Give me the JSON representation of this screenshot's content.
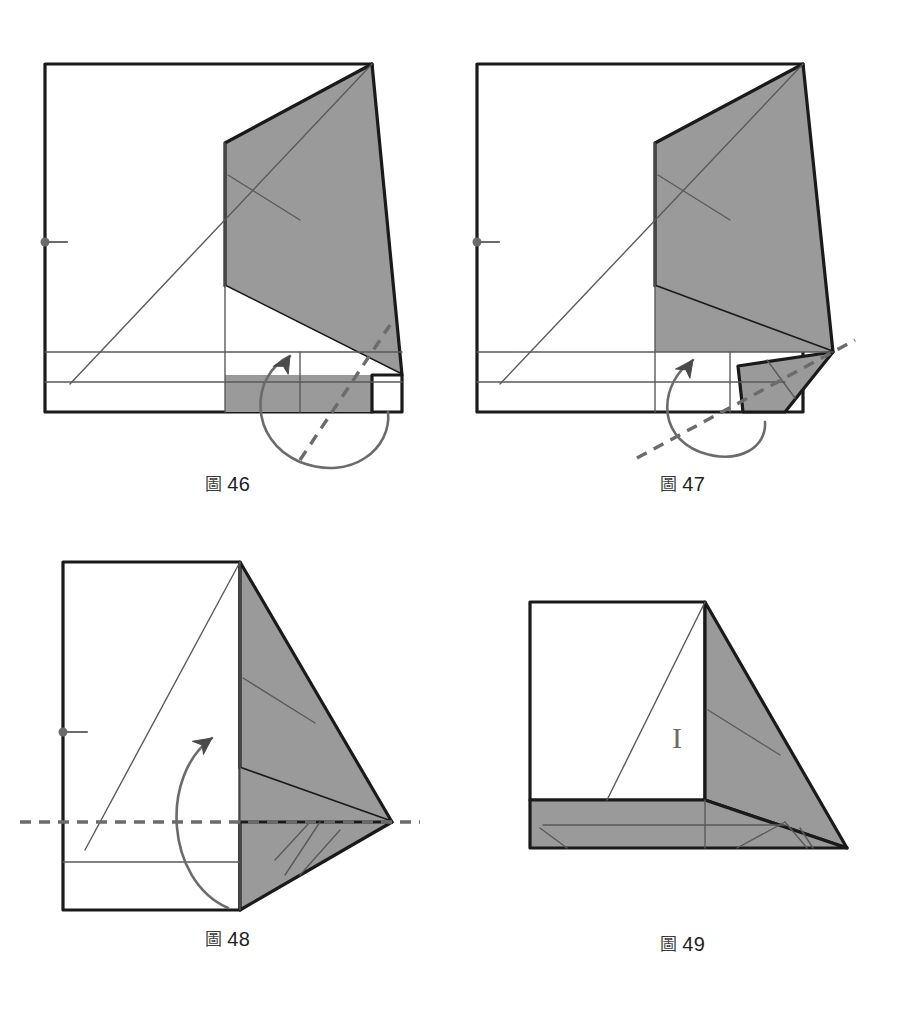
{
  "page": {
    "width": 909,
    "height": 1016,
    "background": "#ffffff",
    "document_type": "origami-folding-instruction-diagram",
    "language": "zh"
  },
  "style": {
    "paper_fill": "#ffffff",
    "shaded_fill": "#9a9a9a",
    "outline_color": "#1a1a1a",
    "crease_color": "#5a5a5a",
    "fold_line_color": "#6b6b6b",
    "arrow_color": "#6b6b6b",
    "marker_color": "#6b6b6b",
    "outline_width": 3.2,
    "crease_width": 1.4,
    "fold_dash": "11 8"
  },
  "figures": [
    {
      "id": "fig-46",
      "caption_mark": "圖",
      "caption_number": "46",
      "caption_text": "圖 46",
      "cell": {
        "left": 0,
        "top": 30,
        "width": 455,
        "height": 470
      },
      "viewbox": "0 0 455 470",
      "caption_top": 440,
      "shapes": {
        "main_sheet": "45,34 372,34 372,345 372,382 400,382 400,382 45,382",
        "white_body": "45,34 372,34 372,382 45,382",
        "shaded_upper": "372,34 400,345 225,256 225,114",
        "shaded_lower": "225,256 400,345 372,382 225,300",
        "shaded_blade": "372,34 400,345 225,256 225,114",
        "right_flap": "372,345 400,345 400,382 372,382",
        "bottom_band": "45,345 400,345 400,382 45,382"
      },
      "polygons": [
        {
          "name": "paper-body",
          "points": "45,34 372,34 372,382 45,382",
          "fill": "#ffffff",
          "stroke": "#1a1a1a",
          "stroke_width": 3.2
        },
        {
          "name": "shaded-flap",
          "points": "372,34 402,345 225,256 225,113",
          "fill": "#9a9a9a",
          "stroke": "#1a1a1a",
          "stroke_width": 3.2
        },
        {
          "name": "shaded-lower-wedge",
          "points": "225,256 402,345 372,382 225,382",
          "fill": "#9a9a9a",
          "stroke": "none",
          "stroke_width": 0
        },
        {
          "name": "white-under-wedge",
          "points": "225,256 402,345 225,345",
          "fill": "#ffffff",
          "stroke": "none",
          "stroke_width": 0
        },
        {
          "name": "right-tab",
          "points": "372,345 402,345 402,382 372,382",
          "fill": "#ffffff",
          "stroke": "#1a1a1a",
          "stroke_width": 3.2
        }
      ],
      "creases": [
        {
          "name": "diagonal-crease",
          "x1": 70,
          "y1": 354,
          "x2": 372,
          "y2": 34
        },
        {
          "name": "vertical-crease",
          "x1": 225,
          "y1": 113,
          "x2": 225,
          "y2": 382
        },
        {
          "name": "horizontal-crease-upper",
          "x1": 45,
          "y1": 322,
          "x2": 402,
          "y2": 322
        },
        {
          "name": "horizontal-crease-lower",
          "x1": 45,
          "y1": 352,
          "x2": 402,
          "y2": 352
        },
        {
          "name": "vertical-crease-right",
          "x1": 300,
          "y1": 322,
          "x2": 300,
          "y2": 382
        },
        {
          "name": "flap-inner-crease",
          "x1": 228,
          "y1": 145,
          "x2": 300,
          "y2": 190
        }
      ],
      "fold_lines": [
        {
          "name": "valley-fold-line",
          "x1": 300,
          "y1": 430,
          "x2": 390,
          "y2": 295,
          "dashed": true
        }
      ],
      "arrows": [
        {
          "name": "fold-rotate-arrow",
          "type": "loop",
          "path": "M 290,326 C 250,345 248,410 300,432 C 352,452 392,418 388,382",
          "head_at": "start",
          "head_angle": -62
        }
      ],
      "markers": [
        {
          "name": "reference-point",
          "type": "dot-tick",
          "x": 45,
          "y": 212,
          "tick_length": 22,
          "radius": 4.5
        }
      ]
    },
    {
      "id": "fig-47",
      "caption_mark": "圖",
      "caption_number": "47",
      "caption_text": "圖 47",
      "cell": {
        "left": 455,
        "top": 30,
        "width": 455,
        "height": 470
      },
      "viewbox": "0 0 455 470",
      "caption_top": 440,
      "polygons": [
        {
          "name": "paper-body",
          "points": "22,34 348,34 348,382 22,382",
          "fill": "#ffffff",
          "stroke": "#1a1a1a",
          "stroke_width": 3.2
        },
        {
          "name": "shaded-flap",
          "points": "348,34 378,322 200,256 200,113",
          "fill": "#9a9a9a",
          "stroke": "#1a1a1a",
          "stroke_width": 3.2
        },
        {
          "name": "shaded-lower-wedge",
          "points": "200,256 378,322 330,322 200,322",
          "fill": "#9a9a9a",
          "stroke": "none",
          "stroke_width": 0
        },
        {
          "name": "folded-out-flap",
          "points": "378,322 330,382 288,382 283,336",
          "fill": "#9a9a9a",
          "stroke": "#1a1a1a",
          "stroke_width": 3.2
        }
      ],
      "creases": [
        {
          "name": "diagonal-crease",
          "x1": 45,
          "y1": 354,
          "x2": 348,
          "y2": 34
        },
        {
          "name": "vertical-crease",
          "x1": 200,
          "y1": 113,
          "x2": 200,
          "y2": 382
        },
        {
          "name": "horizontal-crease-upper",
          "x1": 22,
          "y1": 322,
          "x2": 378,
          "y2": 322
        },
        {
          "name": "horizontal-crease-lower",
          "x1": 22,
          "y1": 352,
          "x2": 330,
          "y2": 352
        },
        {
          "name": "vertical-crease-right",
          "x1": 275,
          "y1": 322,
          "x2": 275,
          "y2": 382
        },
        {
          "name": "flap-inner-crease",
          "x1": 203,
          "y1": 145,
          "x2": 275,
          "y2": 190
        },
        {
          "name": "flap-tab-crease",
          "x1": 312,
          "y1": 330,
          "x2": 340,
          "y2": 368
        }
      ],
      "fold_lines": [
        {
          "name": "valley-fold-line",
          "x1": 182,
          "y1": 428,
          "x2": 400,
          "y2": 310,
          "dashed": true
        }
      ],
      "arrows": [
        {
          "name": "fold-rotate-arrow",
          "type": "loop",
          "path": "M 238,330 C 205,352 200,405 245,422 C 285,436 312,416 310,392",
          "head_at": "start",
          "head_angle": -58
        }
      ],
      "markers": [
        {
          "name": "reference-point",
          "type": "dot-tick",
          "x": 22,
          "y": 212,
          "tick_length": 22,
          "radius": 4.5
        }
      ]
    },
    {
      "id": "fig-48",
      "caption_mark": "圖",
      "caption_number": "48",
      "caption_text": "圖 48",
      "cell": {
        "left": 0,
        "top": 530,
        "width": 455,
        "height": 450
      },
      "viewbox": "0 0 455 450",
      "caption_top": 395,
      "polygons": [
        {
          "name": "paper-body",
          "points": "63,32 240,32 240,380 63,380",
          "fill": "#ffffff",
          "stroke": "#1a1a1a",
          "stroke_width": 3.2
        },
        {
          "name": "shaded-flap",
          "points": "240,32 392,292 240,238 240,32",
          "fill": "#9a9a9a",
          "stroke": "#1a1a1a",
          "stroke_width": 3.2
        },
        {
          "name": "shaded-lower-wedge",
          "points": "240,238 392,292 290,292 240,292",
          "fill": "#9a9a9a",
          "stroke": "none",
          "stroke_width": 0
        },
        {
          "name": "lower-folded-flap",
          "points": "392,292 240,380 240,292 290,292",
          "fill": "#9a9a9a",
          "stroke": "#1a1a1a",
          "stroke_width": 3.2
        }
      ],
      "creases": [
        {
          "name": "diagonal-crease",
          "x1": 85,
          "y1": 320,
          "x2": 240,
          "y2": 32
        },
        {
          "name": "vertical-crease",
          "x1": 240,
          "y1": 32,
          "x2": 240,
          "y2": 380
        },
        {
          "name": "horizontal-crease-lower",
          "x1": 63,
          "y1": 332,
          "x2": 240,
          "y2": 332
        },
        {
          "name": "flap-inner-crease",
          "x1": 243,
          "y1": 148,
          "x2": 315,
          "y2": 193
        },
        {
          "name": "lower-flap-crease-a",
          "x1": 275,
          "y1": 330,
          "x2": 310,
          "y2": 292
        },
        {
          "name": "lower-flap-crease-b",
          "x1": 300,
          "y1": 345,
          "x2": 340,
          "y2": 300
        },
        {
          "name": "lower-flap-crease-c",
          "x1": 285,
          "y1": 345,
          "x2": 320,
          "y2": 292
        }
      ],
      "fold_lines": [
        {
          "name": "valley-fold-line",
          "x1": 20,
          "y1": 292,
          "x2": 420,
          "y2": 292,
          "dashed": true
        }
      ],
      "arrows": [
        {
          "name": "fold-up-arrow",
          "type": "arc",
          "path": "M 228,378 C 165,350 160,245 212,208",
          "head_at": "end",
          "head_angle": -40
        }
      ],
      "markers": [
        {
          "name": "reference-point",
          "type": "dot-tick",
          "x": 63,
          "y": 202,
          "tick_length": 24,
          "radius": 4.5
        }
      ]
    },
    {
      "id": "fig-49",
      "caption_mark": "圖",
      "caption_number": "49",
      "caption_text": "圖 49",
      "cell": {
        "left": 455,
        "top": 560,
        "width": 455,
        "height": 420
      },
      "viewbox": "0 0 455 420",
      "caption_top": 370,
      "polygons": [
        {
          "name": "paper-body-white",
          "points": "75,42 250,42 250,240 75,240",
          "fill": "#ffffff",
          "stroke": "#1a1a1a",
          "stroke_width": 3.2
        },
        {
          "name": "shaded-right-flap",
          "points": "250,42 392,288 250,240",
          "fill": "#9a9a9a",
          "stroke": "#1a1a1a",
          "stroke_width": 3.2
        },
        {
          "name": "shaded-bottom-band",
          "points": "75,240 250,240 392,288 75,288",
          "fill": "#9a9a9a",
          "stroke": "#1a1a1a",
          "stroke_width": 3.2
        }
      ],
      "creases": [
        {
          "name": "diagonal-crease",
          "x1": 152,
          "y1": 240,
          "x2": 250,
          "y2": 42
        },
        {
          "name": "vertical-crease",
          "x1": 250,
          "y1": 240,
          "x2": 250,
          "y2": 288
        },
        {
          "name": "horizontal-crease",
          "x1": 88,
          "y1": 265,
          "x2": 330,
          "y2": 265
        },
        {
          "name": "flap-inner-crease",
          "x1": 253,
          "y1": 150,
          "x2": 325,
          "y2": 195
        },
        {
          "name": "bottom-crease-left",
          "x1": 85,
          "y1": 268,
          "x2": 112,
          "y2": 288
        },
        {
          "name": "bottom-crease-mid",
          "x1": 282,
          "y1": 288,
          "x2": 330,
          "y2": 262
        },
        {
          "name": "bottom-crease-right-a",
          "x1": 330,
          "y1": 262,
          "x2": 352,
          "y2": 288
        },
        {
          "name": "bottom-crease-right-b",
          "x1": 345,
          "y1": 268,
          "x2": 358,
          "y2": 288
        }
      ],
      "fold_lines": [],
      "arrows": [],
      "markers": [
        {
          "name": "i-marker",
          "type": "letter",
          "label": "I",
          "x": 222,
          "y": 188,
          "font_size": 30
        }
      ]
    }
  ]
}
